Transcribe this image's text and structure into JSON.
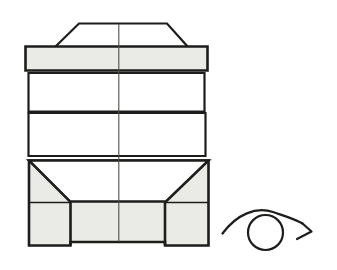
{
  "colors": {
    "background": "#ffffff",
    "shade_fill": "#eaeae7",
    "outline": "#1d1d1b",
    "centerline": "#4f4f4b"
  },
  "figure": {
    "top_trapezoid": {
      "d": "M55,47 L79,23.5 L167,23.5 L188,47 Z"
    },
    "shaded_band": {
      "d": "M25.5,46.5 L207.5,46.5 L207.5,70.5 L25.5,70.5 Z"
    },
    "white_band_1": {
      "d": "M28.5,73 L204.5,73 L204.5,111.5 L28.5,111.5 Z"
    },
    "white_band_2": {
      "d": "M28.5,113 L205.5,113 L205.5,156 L28.5,156 Z"
    },
    "bottom_block": {
      "d": "M29,160.5 L208.5,160.5 L208.5,245.5 L165,245.5 L165,242 L70.5,242 L70.5,245.5 L29,245.5 Z"
    },
    "bottom_trapezoid": {
      "d": "M29,160.5 L208.5,160.5 L166,201.5 L70,201.5 Z"
    },
    "shelf_lines": {
      "d": "M29,202.5 L70,202.5 M166,202.5 L208,202.5"
    },
    "foot_dividers": {
      "d": "M70.5,202 L70.5,245 M165,202 L165,245"
    },
    "center_line": {
      "d": "M118.8,24 L118.8,241.5"
    }
  },
  "rotation_icon": {
    "circle": {
      "d": "M248,232.5 a17.5,17.5 0 1,0 35,0 a17.5,17.5 0 1,0 -35,0"
    },
    "arc": {
      "d": "M222.5,233.5 C237,214 256,206.5 273,212 C283,215.5 294,218.5 302.5,223.5"
    },
    "head": {
      "d": "M302.5,223.5 L311.5,231.5 L297,239"
    }
  }
}
